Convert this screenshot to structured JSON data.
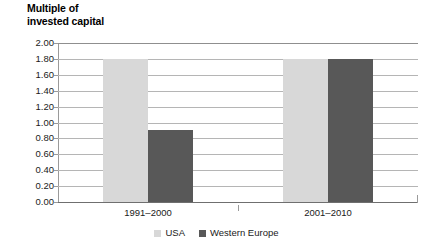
{
  "chart_data": {
    "type": "bar",
    "title": "Multiple of\ninvested capital",
    "xlabel": "",
    "ylabel": "",
    "categories": [
      "1991–2000",
      "2001–2010"
    ],
    "series": [
      {
        "name": "USA",
        "values": [
          1.8,
          1.8
        ],
        "color": "#d8d8d8"
      },
      {
        "name": "Western Europe",
        "values": [
          0.9,
          1.8
        ],
        "color": "#585858"
      }
    ],
    "ylim": [
      0.0,
      2.0
    ],
    "ytick_step": 0.2,
    "yticks": [
      "2.00",
      "1.80",
      "1.60",
      "1.40",
      "1.20",
      "1.00",
      "0.80",
      "0.60",
      "0.40",
      "0.20",
      "0.00"
    ],
    "ytick_values": [
      2.0,
      1.8,
      1.6,
      1.4,
      1.2,
      1.0,
      0.8,
      0.6,
      0.4,
      0.2,
      0.0
    ],
    "grid": true,
    "legend_position": "bottom",
    "background_color": "#ffffff",
    "gridline_color": "#b5b5b5",
    "axis_color": "#9a9a9a"
  },
  "legend": {
    "items": [
      {
        "label": "USA",
        "color": "#d8d8d8"
      },
      {
        "label": "Western Europe",
        "color": "#585858"
      }
    ]
  }
}
